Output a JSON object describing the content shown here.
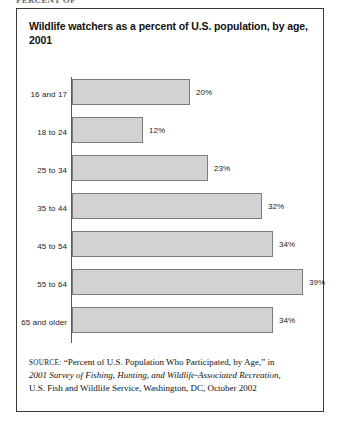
{
  "page": {
    "clipped_header_text": "PERCENT OF"
  },
  "figure": {
    "title": "Wildlife watchers as a percent of U.S. population, by age, 2001",
    "source": {
      "label": "Source:",
      "line1": "“Percent of U.S. Population Who Participated, by Age,” in",
      "line2": "2001 Survey of Fishing, Hunting, and Wildlife-Associated Recreation,",
      "line3": "U.S. Fish and Wildlife Service, Washington, DC, October 2002"
    }
  },
  "chart_data": {
    "type": "bar",
    "orientation": "horizontal",
    "title": "Wildlife watchers as a percent of U.S. population, by age, 2001",
    "xlabel": "",
    "ylabel": "",
    "xlim": [
      0,
      39
    ],
    "grid": false,
    "legend": null,
    "categories": [
      "16 and 17",
      "18 to 24",
      "25 to 34",
      "35 to 44",
      "45 to 54",
      "55 to 64",
      "65 and older"
    ],
    "values": [
      20,
      12,
      23,
      32,
      34,
      39,
      34
    ],
    "value_labels": [
      "20%",
      "12%",
      "23%",
      "32%",
      "34%",
      "39%",
      "34%"
    ],
    "colors": {
      "bar_fill": "#d2d2d2",
      "bar_stroke": "#7d7d7d",
      "axis": "#5a5a5a",
      "text": "#111111",
      "border": "#3a3a3a"
    }
  }
}
